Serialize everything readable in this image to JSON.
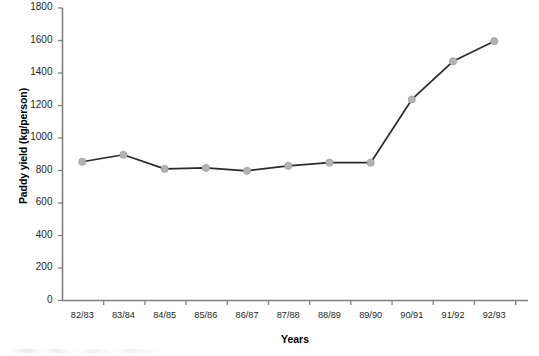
{
  "chart_data": {
    "type": "line",
    "title": "",
    "xlabel": "Years",
    "ylabel": "Paddy yield (kg/person)",
    "categories": [
      "82/83",
      "83/84",
      "84/85",
      "85/86",
      "86/87",
      "87/88",
      "88/89",
      "89/90",
      "90/91",
      "91/92",
      "92/93"
    ],
    "values": [
      854,
      897,
      810,
      816,
      798,
      829,
      848,
      848,
      1237,
      1472,
      1596
    ],
    "series": [
      {
        "name": "Paddy yield",
        "values": [
          854,
          897,
          810,
          816,
          798,
          829,
          848,
          848,
          1237,
          1472,
          1596
        ]
      }
    ],
    "ylim": [
      0,
      1800
    ],
    "yticks": [
      0,
      200,
      400,
      600,
      800,
      1000,
      1200,
      1400,
      1600,
      1800
    ],
    "ytick_labels": [
      "0",
      "200",
      "400",
      "600",
      "800",
      "1000",
      "1200",
      "1400",
      "1600",
      "1800"
    ],
    "grid": false,
    "legend": false,
    "legend_position": "none",
    "line_color": "#2a2a2a",
    "marker_color": "#b3b3b3",
    "marker_edge_color": "#a0a0a0",
    "axis_color": "#808080",
    "marker_shape": "circle"
  }
}
